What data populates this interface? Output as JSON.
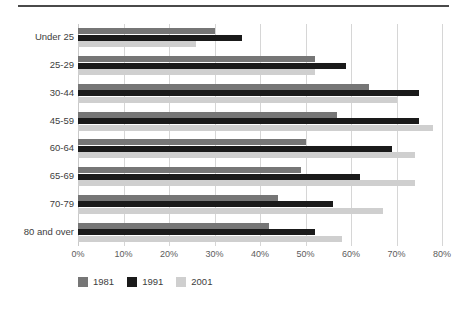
{
  "chart_data": {
    "type": "bar",
    "orientation": "horizontal",
    "title": "",
    "xlabel": "",
    "ylabel": "",
    "xlim": [
      0,
      80
    ],
    "xticks": [
      "0%",
      "10%",
      "20%",
      "30%",
      "40%",
      "50%",
      "60%",
      "70%",
      "80%"
    ],
    "xtick_values": [
      0,
      10,
      20,
      30,
      40,
      50,
      60,
      70,
      80
    ],
    "grid": true,
    "legend_position": "bottom-left",
    "categories": [
      "Under 25",
      "25-29",
      "30-44",
      "45-59",
      "60-64",
      "65-69",
      "70-79",
      "80 and over"
    ],
    "series": [
      {
        "name": "1981",
        "color": "#767676",
        "values": [
          30,
          52,
          64,
          57,
          50,
          49,
          44,
          42
        ]
      },
      {
        "name": "1991",
        "color": "#1a1a1a",
        "values": [
          36,
          59,
          75,
          75,
          69,
          62,
          56,
          52
        ]
      },
      {
        "name": "2001",
        "color": "#cfcfcf",
        "values": [
          26,
          52,
          70,
          78,
          74,
          74,
          67,
          58
        ]
      }
    ]
  }
}
